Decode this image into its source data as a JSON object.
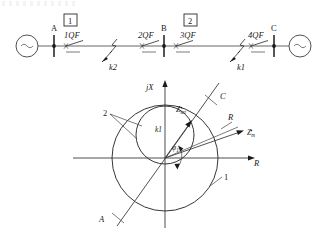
{
  "figure": {
    "one_line": {
      "label_source_left": "~",
      "label_source_right": "~",
      "buses": [
        {
          "name": "A",
          "x": 54
        },
        {
          "name": "B",
          "x": 164
        },
        {
          "name": "C",
          "x": 274
        }
      ],
      "breakers": [
        {
          "name": "1QF",
          "x": 72
        },
        {
          "name": "2QF",
          "x": 146
        },
        {
          "name": "3QF",
          "x": 182
        },
        {
          "name": "4QF",
          "x": 256
        }
      ],
      "zone_boxes": [
        {
          "name": "1",
          "x": 70,
          "y": 14
        },
        {
          "name": "2",
          "x": 180,
          "y": 14
        }
      ],
      "faults": [
        {
          "name": "k2",
          "x": 108
        },
        {
          "name": "k1",
          "x": 236
        }
      ]
    },
    "impedance_plot": {
      "axis_vertical_label": "jX",
      "axis_horizontal_label": "R",
      "characteristic_labels": [
        {
          "name": "2",
          "text": "2"
        },
        {
          "name": "1",
          "text": "1"
        }
      ],
      "line_end_labels": [
        {
          "name": "C",
          "text": "C"
        },
        {
          "name": "A",
          "text": "A"
        }
      ],
      "vector_labels": [
        {
          "name": "z-set",
          "base": "Z",
          "sub": "set"
        },
        {
          "name": "z-m",
          "base": "Z",
          "sub": "m"
        },
        {
          "name": "line-resistance",
          "text": "R"
        }
      ],
      "fault_point_label": "k1",
      "angle_label_base": "φ",
      "angle_label_sub": "1",
      "colors": {
        "line": "#2b2b2b",
        "wire": "#555555",
        "text": "#1a1a1a",
        "background": "#ffffff"
      }
    }
  }
}
